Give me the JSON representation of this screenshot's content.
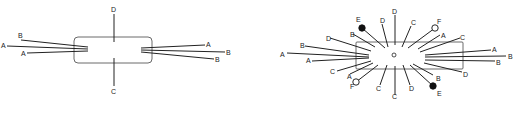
{
  "diagrams": [
    {
      "id": "left",
      "description": "rectangle with lines entering from sides and top/bottom",
      "lines": [
        {
          "label": "B"
        },
        {
          "label": "A"
        },
        {
          "label": "A"
        },
        {
          "label": "A"
        },
        {
          "label": "B"
        },
        {
          "label": "B"
        },
        {
          "label": "D"
        },
        {
          "label": "C"
        }
      ]
    },
    {
      "id": "right",
      "description": "radial arrangement of labeled lines around a central point with ball-tipped ends",
      "lines": [
        {
          "label": "A"
        },
        {
          "label": "B"
        },
        {
          "label": "A"
        },
        {
          "label": "D"
        },
        {
          "label": "B"
        },
        {
          "label": "C"
        },
        {
          "label": "A"
        },
        {
          "label": "E",
          "tip": "filled"
        },
        {
          "label": "F",
          "tip": "open"
        },
        {
          "label": "D"
        },
        {
          "label": "D"
        },
        {
          "label": "C"
        },
        {
          "label": "F",
          "tip": "open"
        },
        {
          "label": "A"
        },
        {
          "label": "C"
        },
        {
          "label": "A"
        },
        {
          "label": "B"
        },
        {
          "label": "B"
        },
        {
          "label": "D"
        },
        {
          "label": "B"
        },
        {
          "label": "C"
        },
        {
          "label": "C"
        },
        {
          "label": "D"
        },
        {
          "label": "E",
          "tip": "filled"
        }
      ]
    }
  ]
}
